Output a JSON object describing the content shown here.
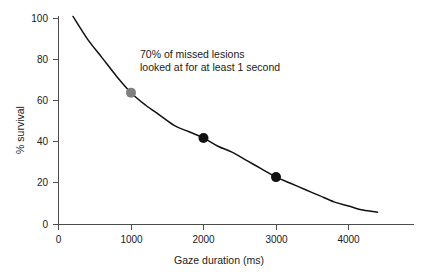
{
  "chart_data": {
    "type": "line",
    "title": "",
    "xlabel": "Gaze duration (ms)",
    "ylabel": "% survival",
    "xlim": [
      0,
      4700
    ],
    "ylim": [
      0,
      100
    ],
    "grid": false,
    "legend": "none",
    "xticks": [
      0,
      1000,
      2000,
      3000,
      4000
    ],
    "xtick_labels": [
      "0",
      "1000",
      "2000",
      "3000",
      "4000"
    ],
    "yticks": [
      0,
      20,
      40,
      60,
      80,
      100
    ],
    "ytick_labels": [
      "0",
      "20",
      "40",
      "60",
      "80",
      "100"
    ],
    "series": [
      {
        "name": "survival curve",
        "type": "line",
        "color": "#111111",
        "x": [
          200,
          400,
          600,
          800,
          1000,
          1200,
          1400,
          1600,
          1800,
          2000,
          2200,
          2400,
          2600,
          2800,
          3000,
          3200,
          3400,
          3600,
          3800,
          4000,
          4200,
          4400
        ],
        "y": [
          101,
          90,
          81,
          72,
          64,
          58,
          53,
          48,
          45,
          42,
          38,
          35,
          31,
          27,
          23,
          20,
          17,
          14,
          11,
          9,
          7,
          6
        ]
      },
      {
        "name": "markers",
        "type": "scatter",
        "points": [
          {
            "x": 1000,
            "y": 64,
            "color": "#808080",
            "label": "1000 ms, 64% survival"
          },
          {
            "x": 2000,
            "y": 42,
            "color": "#111111",
            "label": "2000 ms, 42% survival"
          },
          {
            "x": 3000,
            "y": 23,
            "color": "#111111",
            "label": "3000 ms, 23% survival"
          }
        ]
      }
    ],
    "annotations": [
      {
        "text": "70% of missed lesions",
        "x": 1130,
        "y": 77
      },
      {
        "text": "looked at for at least 1 second",
        "x": 1130,
        "y": 71
      }
    ]
  },
  "annotation": {
    "line1": "70% of missed lesions",
    "line2": "looked at for at least 1 second"
  },
  "axes": {
    "x_title": "Gaze duration (ms)",
    "y_title": "% survival",
    "x_tick_0": "0",
    "x_tick_1": "1000",
    "x_tick_2": "2000",
    "x_tick_3": "3000",
    "x_tick_4": "4000",
    "y_tick_0": "0",
    "y_tick_1": "20",
    "y_tick_2": "40",
    "y_tick_3": "60",
    "y_tick_4": "80",
    "y_tick_5": "100"
  },
  "colors": {
    "curve": "#111111",
    "axis": "#4d4d4d",
    "marker_highlight": "#808080",
    "marker_normal": "#111111",
    "background": "#ffffff"
  }
}
